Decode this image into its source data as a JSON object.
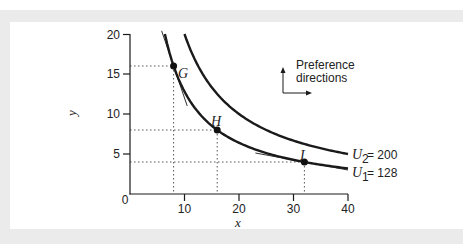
{
  "chart_data": {
    "type": "line",
    "title": "",
    "xlabel": "x",
    "ylabel": "y",
    "xlim": [
      0,
      40
    ],
    "ylim": [
      0,
      20
    ],
    "x_ticks": [
      0,
      10,
      20,
      30,
      40
    ],
    "y_ticks": [
      0,
      5,
      10,
      15,
      20
    ],
    "grid": false,
    "series": [
      {
        "name": "U1 = 128",
        "label_main": "U",
        "label_sub": "1",
        "label_value": "= 128",
        "utility": 128,
        "formula": "x*y = 128"
      },
      {
        "name": "U2 = 200",
        "label_main": "U",
        "label_sub": "2",
        "label_value": "= 200",
        "utility": 200,
        "formula": "x*y = 200"
      }
    ],
    "points": [
      {
        "label": "G",
        "x": 8,
        "y": 16,
        "curve": "U1"
      },
      {
        "label": "H",
        "x": 16,
        "y": 8,
        "curve": "U1"
      },
      {
        "label": "I",
        "x": 32,
        "y": 4,
        "curve": "U1"
      }
    ],
    "annotations": [
      {
        "text_line1": "Preference",
        "text_line2": "directions",
        "type": "arrows up and right"
      },
      {
        "text": "tangent lines at G and I",
        "type": "tangent"
      },
      {
        "text": "dotted reference lines from points to axes",
        "type": "guides"
      }
    ]
  },
  "labels": {
    "x_title": "x",
    "y_title": "y",
    "x_ticks": [
      "0",
      "10",
      "20",
      "30",
      "40"
    ],
    "y_ticks": [
      "5",
      "10",
      "15",
      "20"
    ],
    "point_g": "G",
    "point_h": "H",
    "point_i": "I",
    "u2_main": "U",
    "u2_sub": "2",
    "u2_value": " = 200",
    "u1_main": "U",
    "u1_sub": "1",
    "u1_value": " = 128",
    "pref_line1": "Preference",
    "pref_line2": "directions"
  },
  "colors": {
    "frame": "#ebebeb",
    "ink": "#1a1a1a",
    "guide": "#555555"
  }
}
